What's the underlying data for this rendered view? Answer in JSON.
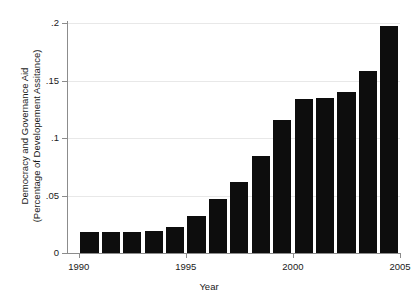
{
  "chart_data": {
    "type": "bar",
    "title": "",
    "xlabel": "Year",
    "ylabel_line1": "Democracy and Governance Aid",
    "ylabel_line2": "(Percentage of Developement Assitance)",
    "categories": [
      1990,
      1991,
      1992,
      1993,
      1994,
      1995,
      1996,
      1997,
      1998,
      1999,
      2000,
      2001,
      2002,
      2003,
      2004
    ],
    "values": [
      0.018,
      0.018,
      0.018,
      0.019,
      0.023,
      0.032,
      0.047,
      0.062,
      0.084,
      0.116,
      0.134,
      0.135,
      0.14,
      0.158,
      0.197
    ],
    "xlim": [
      1989.5,
      2005
    ],
    "ylim": [
      0,
      0.2
    ],
    "xticks": [
      1990,
      1995,
      2000,
      2005
    ],
    "xtick_labels": [
      "1990",
      "1995",
      "2000",
      "2005"
    ],
    "yticks": [
      0,
      0.05,
      0.1,
      0.15,
      0.2
    ],
    "ytick_labels": [
      "0",
      ".05",
      ".1",
      ".15",
      ".2"
    ],
    "grid": "horizontal",
    "legend": "none",
    "bar_color": "#0d0d0d",
    "grid_color": "#e8e8e8",
    "axis_color": "#8c8c8c"
  }
}
